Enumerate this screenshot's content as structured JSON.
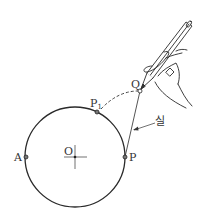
{
  "diagram": {
    "circle": {
      "center_label": "O",
      "cx": 75,
      "cy": 157,
      "r": 50
    },
    "points": [
      {
        "id": "A",
        "label": "A",
        "x": 26,
        "y": 157
      },
      {
        "id": "P",
        "label": "P",
        "x": 125,
        "y": 157
      },
      {
        "id": "P1",
        "label": "P",
        "subscript": "1",
        "x": 97,
        "y": 112
      },
      {
        "id": "Q",
        "label": "Q",
        "x": 140,
        "y": 91
      }
    ],
    "string_label": "실",
    "colors": {
      "stroke": "#2a2a2a",
      "background": "#ffffff"
    }
  }
}
